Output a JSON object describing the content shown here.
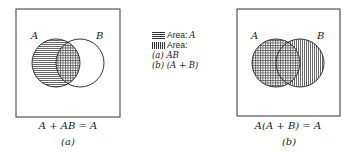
{
  "panels": [
    {
      "id": "a",
      "circle_a_label": "A",
      "circle_b_label": "B",
      "equation": "A + AB = A",
      "caption": "(a)"
    },
    {
      "id": "b",
      "circle_a_label": "A",
      "circle_b_label": "B",
      "equation": "A(A + B) = A",
      "caption": "(b)"
    }
  ],
  "legend": {
    "horizontal_label": "Area: ",
    "horizontal_var": "A",
    "vertical_label": "Area:",
    "item_a": "(a) AB",
    "item_b": "(b) (A + B)"
  }
}
